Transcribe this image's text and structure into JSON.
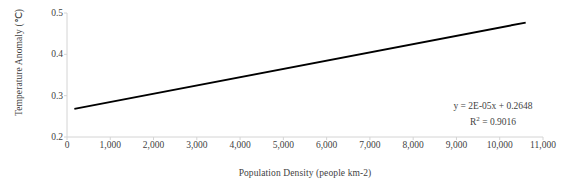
{
  "chart_data": {
    "type": "scatter",
    "title": "",
    "xlabel": "Population Density (people km-2)",
    "ylabel": "Temperature Anomaly (℃)",
    "xlim": [
      0,
      11000
    ],
    "ylim": [
      0.2,
      0.5
    ],
    "grid": false,
    "legend": null,
    "xticks": [
      "0",
      "1,000",
      "2,000",
      "3,000",
      "4,000",
      "5,000",
      "6,000",
      "7,000",
      "8,000",
      "9,000",
      "10,000",
      "11,000"
    ],
    "xtick_values": [
      0,
      1000,
      2000,
      3000,
      4000,
      5000,
      6000,
      7000,
      8000,
      9000,
      10000,
      11000
    ],
    "yticks": [
      "0.2",
      "0.3",
      "0.4",
      "0.5"
    ],
    "ytick_values": [
      0.2,
      0.3,
      0.4,
      0.5
    ],
    "marker_color": "#808080",
    "trendline_color": "#000000",
    "points": [
      {
        "x": 60,
        "y": 0.269
      },
      {
        "x": 75,
        "y": 0.251
      },
      {
        "x": 120,
        "y": 0.247
      },
      {
        "x": 170,
        "y": 0.256
      },
      {
        "x": 1050,
        "y": 0.318
      },
      {
        "x": 1640,
        "y": 0.316
      },
      {
        "x": 2950,
        "y": 0.331
      },
      {
        "x": 3300,
        "y": 0.349
      },
      {
        "x": 3800,
        "y": 0.339
      },
      {
        "x": 3880,
        "y": 0.323
      },
      {
        "x": 4400,
        "y": 0.331
      },
      {
        "x": 6550,
        "y": 0.372
      },
      {
        "x": 9680,
        "y": 0.44
      },
      {
        "x": 10040,
        "y": 0.427
      }
    ],
    "trendline": {
      "equation": "y = 2E-05x + 0.2648",
      "r2_label": "R² = 0.9016",
      "r2_prefix": "R",
      "r2_sup": "2",
      "r2_suffix": " = 0.9016",
      "slope": 2e-05,
      "intercept": 0.2648,
      "r_squared": 0.9016,
      "x_start": 170,
      "x_end": 10600
    }
  }
}
